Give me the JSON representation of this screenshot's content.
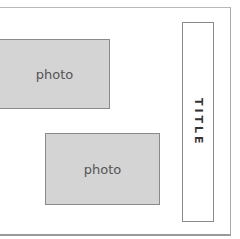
{
  "layout": {
    "photos": [
      {
        "label": "photo"
      },
      {
        "label": "photo"
      }
    ],
    "title": {
      "label": "TITLE"
    }
  }
}
